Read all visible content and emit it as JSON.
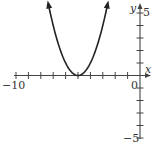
{
  "chart_data": {
    "type": "line",
    "title": "",
    "function": "y = (x + 5)^2",
    "xlabel": "x",
    "ylabel": "y",
    "xlim": [
      -10,
      0
    ],
    "ylim": [
      -5,
      5
    ],
    "x_tick_labels": [
      "-10",
      "0"
    ],
    "y_tick_labels": [
      "5",
      "-5"
    ],
    "x_ticks": [
      -10,
      -9,
      -8,
      -7,
      -6,
      -5,
      -4,
      -3,
      -2,
      -1,
      0
    ],
    "y_ticks": [
      -5,
      -4,
      -3,
      -2,
      -1,
      0,
      1,
      2,
      3,
      4,
      5
    ],
    "grid": false,
    "legend": null,
    "series": [
      {
        "name": "parabola",
        "vertex": [
          -5,
          0
        ],
        "x": [
          -7.4,
          -7,
          -6.5,
          -6,
          -5.5,
          -5,
          -4.5,
          -4,
          -3.5,
          -3,
          -2.6
        ],
        "y": [
          5.76,
          4,
          2.25,
          1,
          0.25,
          0,
          0.25,
          1,
          2.25,
          4,
          5.76
        ],
        "arrows_at_ends": true
      }
    ]
  },
  "labels": {
    "x_axis": "x",
    "y_axis": "y",
    "x_min": "−10",
    "x_origin": "0",
    "y_max": "5",
    "y_min": "−5"
  },
  "colors": {
    "axis": "#444444",
    "curve": "#222222",
    "text": "#333333"
  }
}
